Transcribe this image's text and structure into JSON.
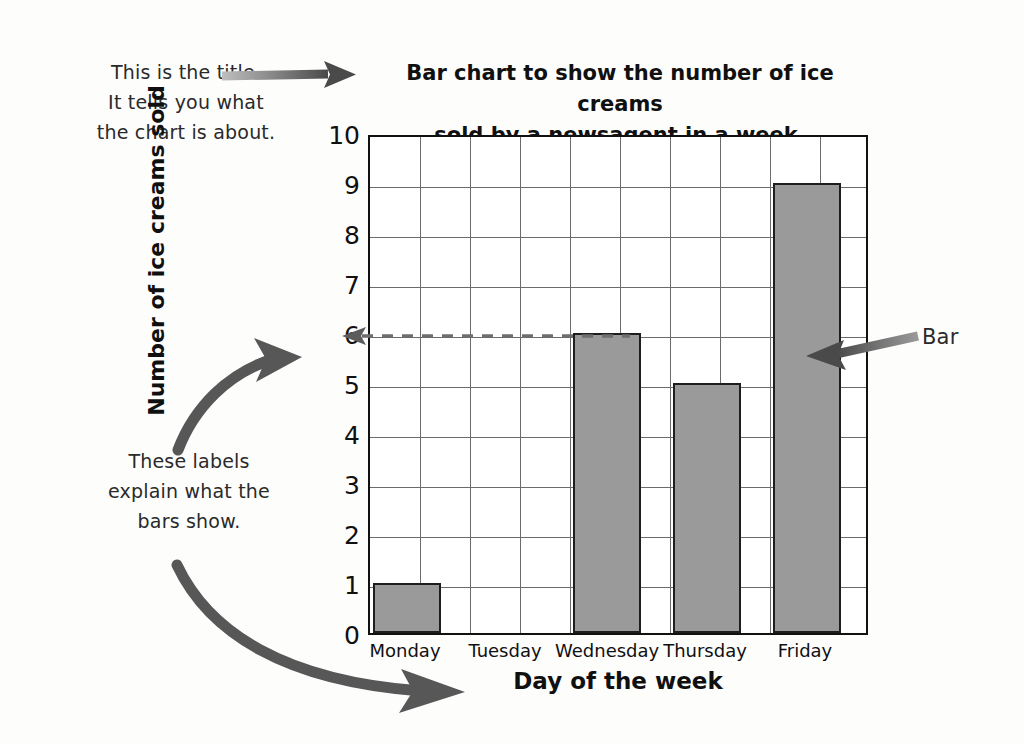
{
  "chart_data": {
    "type": "bar",
    "title": "Bar chart to show the number of ice creams sold by a newsagent in a week.",
    "title_line1": "Bar chart to show the number of ice creams",
    "title_line2": "sold by a newsagent in a week.",
    "categories": [
      "Monday",
      "Tuesday",
      "Wednesday",
      "Thursday",
      "Friday"
    ],
    "values": [
      1,
      0,
      6,
      5,
      9
    ],
    "xlabel": "Day of the week",
    "ylabel": "Number of ice creams sold",
    "ylim": [
      0,
      10
    ],
    "ytick_labels": [
      "0",
      "1",
      "2",
      "3",
      "4",
      "5",
      "6",
      "7",
      "8",
      "9",
      "10"
    ],
    "grid": true,
    "legend": "none",
    "bar_color": "#9a9a9a",
    "bar_border_color": "#1e1e1e",
    "gridline_color": "#6b6b6b",
    "axis_color": "#111111"
  },
  "annotations": {
    "title_note": "This is the title.\nIt tells you what\nthe chart is about.",
    "labels_note": "These labels\nexplain what the\nbars show.",
    "bar_note": "Bar",
    "readout_value": "6",
    "arrow_color": "#575757"
  }
}
